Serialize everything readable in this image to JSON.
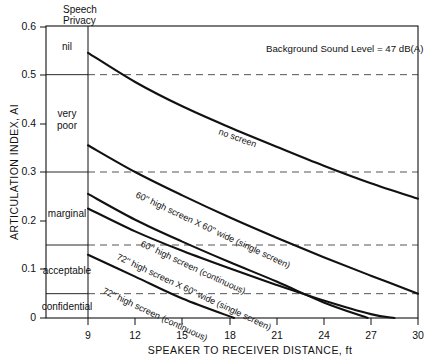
{
  "header": {
    "privacy_col_title_line1": "Speech",
    "privacy_col_title_line2": "Privacy"
  },
  "annotation": {
    "background_sound": "Background Sound Level = 47 dB(A)"
  },
  "axes": {
    "ylabel": "ARTICULATION INDEX, AI",
    "xlabel": "SPEAKER TO RECEIVER DISTANCE, ft",
    "xticks": [
      "9",
      "12",
      "15",
      "18",
      "21",
      "24",
      "27",
      "30"
    ],
    "yticks": [
      "0",
      "0.1",
      "0.2",
      "0.3",
      "0.4",
      "0.5",
      "0.6"
    ]
  },
  "privacy_bands": [
    {
      "label": "nil",
      "top": 0.6,
      "bottom": 0.5
    },
    {
      "label": "very\npoor",
      "top": 0.5,
      "bottom": 0.3,
      "line1": "very",
      "line2": "poor"
    },
    {
      "label": "marginal",
      "top": 0.3,
      "bottom": 0.15
    },
    {
      "label": "acceptable",
      "top": 0.15,
      "bottom": 0.05
    },
    {
      "label": "confidential",
      "top": 0.05,
      "bottom": 0.0
    }
  ],
  "chart_data": {
    "type": "line",
    "title": "",
    "subtitle": "Background Sound Level = 47 dB(A)",
    "xlabel": "SPEAKER TO RECEIVER DISTANCE, ft",
    "ylabel": "ARTICULATION INDEX, AI",
    "xlim": [
      6,
      30
    ],
    "ylim": [
      0,
      0.6
    ],
    "xticks": [
      9,
      12,
      15,
      18,
      21,
      24,
      27,
      30
    ],
    "yticks": [
      0,
      0.1,
      0.2,
      0.3,
      0.4,
      0.5,
      0.6
    ],
    "grid": false,
    "dashed_reference_levels": [
      0.5,
      0.3,
      0.15,
      0.05
    ],
    "legend": "inline-curve-labels",
    "series": [
      {
        "name": "no screen",
        "label": "no screen",
        "x": [
          9,
          12,
          15,
          18,
          21,
          24,
          27,
          30
        ],
        "y": [
          0.545,
          0.485,
          0.435,
          0.392,
          0.352,
          0.313,
          0.277,
          0.245
        ]
      },
      {
        "name": "60\" high screen X 60\" wide (single screen)",
        "label": "60'' high screen X 60'' wide (single screen)",
        "x": [
          9,
          12,
          15,
          18,
          21,
          24,
          27,
          30
        ],
        "y": [
          0.355,
          0.3,
          0.252,
          0.207,
          0.165,
          0.125,
          0.087,
          0.05
        ]
      },
      {
        "name": "60\" high screen (continuous)",
        "label": "60'' high screen (continuous)",
        "x": [
          9,
          12,
          15,
          18,
          21,
          24,
          26.8
        ],
        "y": [
          0.255,
          0.202,
          0.157,
          0.115,
          0.075,
          0.032,
          0.0
        ]
      },
      {
        "name": "72\" high screen X 60\" wide (single screen)",
        "label": "72'' high screen X 60'' wide (single screen)",
        "x": [
          9,
          12,
          15,
          18,
          21,
          24,
          27,
          28.5
        ],
        "y": [
          0.225,
          0.178,
          0.138,
          0.102,
          0.068,
          0.036,
          0.008,
          0.0
        ]
      },
      {
        "name": "72\" high screen (continuous)",
        "label": "72'' high screen (continuous)",
        "x": [
          9,
          12,
          15,
          18.3
        ],
        "y": [
          0.13,
          0.085,
          0.04,
          0.0
        ]
      }
    ]
  },
  "curve_labels": {
    "no_screen": "no screen",
    "s60_single": "60'' high screen X 60'' wide (single screen)",
    "s60_cont": "60'' high screen (continuous)",
    "s72_single": "72'' high screen X 60'' wide (single screen)",
    "s72_cont": "72'' high screen (continuous)"
  }
}
